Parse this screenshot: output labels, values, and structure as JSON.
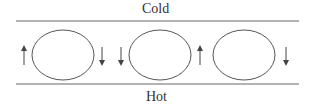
{
  "diagram": {
    "top_label": "Cold",
    "bottom_label": "Hot",
    "cells": [
      {
        "left_arrow": "up",
        "right_arrow": "down"
      },
      {
        "left_arrow": "down",
        "right_arrow": null
      },
      {
        "left_arrow": "up",
        "right_arrow": "down"
      }
    ],
    "colors": {
      "stroke": "#555555",
      "text": "#333333"
    }
  }
}
